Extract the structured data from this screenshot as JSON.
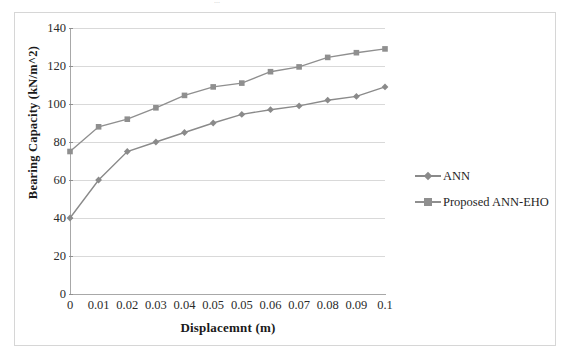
{
  "figure": {
    "top_fragment_text": "...",
    "border_color": "#d6d6d6",
    "background": "#ffffff"
  },
  "legend": {
    "position": "right",
    "entries": [
      {
        "label": "ANN",
        "marker": "diamond",
        "color": "#8a8a8a"
      },
      {
        "label": "Proposed ANN-EHO",
        "marker": "square",
        "color": "#8f8f8f"
      }
    ]
  },
  "axes": {
    "x_title": "Displacemnt (m)",
    "y_title": "Bearing Capacity (kN/m^2)",
    "y_ticks": [
      "0",
      "20",
      "40",
      "60",
      "80",
      "100",
      "120",
      "140"
    ],
    "x_ticks": [
      "0",
      "0.01",
      "0.02",
      "0.03",
      "0.04",
      "0.05",
      "0.05",
      "0.06",
      "0.07",
      "0.08",
      "0.09",
      "0.1"
    ],
    "grid": true,
    "grid_color": "#d9d9d9",
    "axis_color": "#a8a8a8"
  },
  "chart_data": {
    "type": "line",
    "title": "",
    "subtitle": "",
    "xlabel": "Displacemnt (m)",
    "ylabel": "Bearing Capacity (kN/m^2)",
    "xlim": [
      0,
      11
    ],
    "ylim": [
      0,
      140
    ],
    "ytick_step": 20,
    "grid": true,
    "legend_position": "right",
    "x": [
      "0",
      "0.01",
      "0.02",
      "0.03",
      "0.04",
      "0.05",
      "0.05",
      "0.06",
      "0.07",
      "0.08",
      "0.09",
      "0.1"
    ],
    "categories": [
      "0",
      "0.01",
      "0.02",
      "0.03",
      "0.04",
      "0.05",
      "0.05",
      "0.06",
      "0.07",
      "0.08",
      "0.09",
      "0.1"
    ],
    "series": [
      {
        "name": "ANN",
        "marker": "diamond",
        "color": "#8a8a8a",
        "values": [
          40,
          60,
          75,
          80,
          85,
          90,
          94.5,
          97,
          99,
          102,
          104,
          109
        ]
      },
      {
        "name": "Proposed ANN-EHO",
        "marker": "square",
        "color": "#8f8f8f",
        "values": [
          75,
          88,
          92,
          98,
          104.5,
          109,
          111,
          117,
          119.5,
          124.5,
          127,
          129
        ]
      }
    ],
    "annotations": []
  }
}
